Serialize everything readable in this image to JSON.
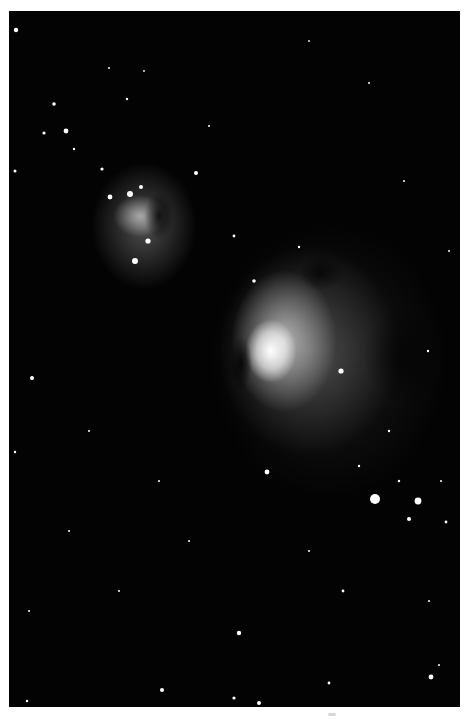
{
  "image": {
    "subject": "Orion Nebula (M42) and Running Man Nebula",
    "palette": "grayscale",
    "background_color": "#030303",
    "border_color": "#ffffff",
    "frame": {
      "left": 9,
      "top": 11,
      "width": 451,
      "height": 696
    }
  },
  "regions": [
    {
      "name": "running-man-nebula",
      "center": [
        131,
        205
      ]
    },
    {
      "name": "orion-nebula-core",
      "center": [
        262,
        340
      ]
    },
    {
      "name": "bright-star-pair",
      "center": [
        375,
        488
      ]
    }
  ]
}
